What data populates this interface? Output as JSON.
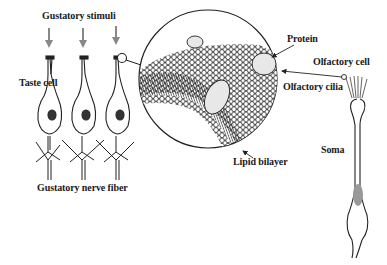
{
  "diagram": {
    "labels": {
      "gustatory_stimuli": "Gustatory stimuli",
      "taste_cell": "Taste cell",
      "gustatory_nerve_fiber": "Gustatory nerve fiber",
      "protein": "Protein",
      "lipid_bilayer": "Lipid bilayer",
      "olfactory_cell": "Olfactory cell",
      "olfactory_cilia": "Olfactory cilia",
      "soma": "Soma"
    },
    "colors": {
      "line": "#1a1a1a",
      "arrow_stimuli": "#888888",
      "nucleus_olfactory": "#999999",
      "protein_fill": "#e8e8e8",
      "background": "#ffffff"
    }
  }
}
